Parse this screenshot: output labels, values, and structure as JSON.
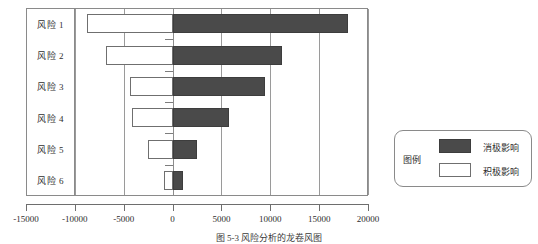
{
  "figure": {
    "caption": "图 5-3  风险分析的龙卷风图"
  },
  "legend": {
    "title": "图例",
    "entries": [
      {
        "label": "消极影响",
        "swatch": "dark-filled-square",
        "color": "#4a4a4a"
      },
      {
        "label": "积极影响",
        "swatch": "white-outlined-square",
        "color": "#ffffff"
      }
    ]
  },
  "axis": {
    "x_ticks": [
      "-15000",
      "-10000",
      "-5000",
      "0",
      "5000",
      "10000",
      "15000",
      "20000"
    ],
    "x_tick_values": [
      -15000,
      -10000,
      -5000,
      0,
      5000,
      10000,
      15000,
      20000
    ]
  },
  "chart_data": {
    "type": "bar",
    "title": "图 5-3  风险分析的龙卷风图",
    "orientation": "horizontal",
    "style": "tornado",
    "xlabel": "",
    "ylabel": "",
    "xlim": [
      -15000,
      20000
    ],
    "grid": true,
    "legend_position": "right-outside",
    "categories": [
      "风险 1",
      "风险 2",
      "风险 3",
      "风险 4",
      "风险 5",
      "风险 6"
    ],
    "series": [
      {
        "name": "消极影响",
        "color": "#4a4a4a",
        "values": [
          18000,
          11200,
          9500,
          5800,
          2500,
          1100
        ]
      },
      {
        "name": "积极影响",
        "color": "#ffffff",
        "values": [
          -8800,
          -6800,
          -4400,
          -4200,
          -2500,
          -900
        ]
      }
    ]
  }
}
